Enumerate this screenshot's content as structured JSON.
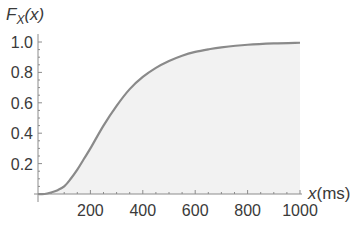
{
  "chart_data": {
    "type": "area",
    "title": "",
    "ylabel": "F_X(x)",
    "ylabel_parts": {
      "main": "F",
      "sub": "X",
      "arg": "(x)"
    },
    "xlabel": "x(ms)",
    "xlabel_parts": {
      "var": "x",
      "unit": "(ms)"
    },
    "xlim": [
      0,
      1000
    ],
    "ylim": [
      0,
      1.0
    ],
    "x_ticks": [
      200,
      400,
      600,
      800,
      1000
    ],
    "x_tick_labels": [
      "200",
      "400",
      "600",
      "800",
      "1000"
    ],
    "y_ticks": [
      0.2,
      0.4,
      0.6,
      0.8,
      1.0
    ],
    "y_tick_labels": [
      "0.2",
      "0.4",
      "0.6",
      "0.8",
      "1.0"
    ],
    "grid": false,
    "legend": null,
    "series": [
      {
        "name": "F_X(x)",
        "x": [
          0,
          25,
          50,
          75,
          100,
          125,
          150,
          175,
          200,
          250,
          300,
          350,
          400,
          450,
          500,
          550,
          600,
          650,
          700,
          800,
          900,
          1000
        ],
        "values": [
          0.0,
          0.0,
          0.01,
          0.025,
          0.05,
          0.1,
          0.16,
          0.23,
          0.3,
          0.45,
          0.58,
          0.69,
          0.77,
          0.83,
          0.875,
          0.91,
          0.935,
          0.952,
          0.965,
          0.982,
          0.991,
          0.995
        ],
        "line_color": "#8a8a8a",
        "fill_color": "#f2f2f2"
      }
    ]
  },
  "colors": {
    "axis": "#8c8c8c",
    "curve": "#8a8a8a",
    "fill": "#f2f2f2",
    "text": "#3a3a3a"
  }
}
